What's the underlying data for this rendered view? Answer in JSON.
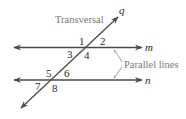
{
  "diagram": {
    "title_label": "Transversal",
    "parallel_label": "Parallel lines",
    "lines": {
      "transversal": {
        "name": "q"
      },
      "top_parallel": {
        "name": "m"
      },
      "bottom_parallel": {
        "name": "n"
      }
    },
    "angles": {
      "a1": "1",
      "a2": "2",
      "a3": "3",
      "a4": "4",
      "a5": "5",
      "a6": "6",
      "a7": "7",
      "a8": "8"
    },
    "colors": {
      "line": "#4a4a4a",
      "text": "#2b2b2b",
      "caption": "#7a7a7a"
    }
  }
}
